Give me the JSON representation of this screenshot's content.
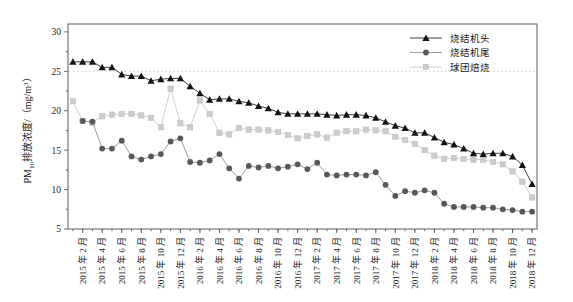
{
  "chart_data": {
    "type": "line",
    "title": "",
    "xlabel": "",
    "ylabel": "PM10排放浓度/（mg/m3）",
    "ylabel_parts": {
      "prefix": "PM",
      "subscript": "10",
      "middle": "排放浓度/（mg/m",
      "superscript": "3",
      "suffix": "）"
    },
    "ylim": [
      5,
      31
    ],
    "yticks": [
      5,
      10,
      15,
      20,
      25,
      30
    ],
    "ytick_labels": [
      "5",
      "10",
      "15",
      "20",
      "25",
      "30"
    ],
    "grid": "horizontal-dotted-at-25",
    "legend_position": "top-right",
    "x": [
      "2015年1月",
      "2015年2月",
      "2015年3月",
      "2015年4月",
      "2015年5月",
      "2015年6月",
      "2015年7月",
      "2015年8月",
      "2015年9月",
      "2015年10月",
      "2015年11月",
      "2015年12月",
      "2016年1月",
      "2016年2月",
      "2016年3月",
      "2016年4月",
      "2016年5月",
      "2016年6月",
      "2016年7月",
      "2016年8月",
      "2016年9月",
      "2016年10月",
      "2016年11月",
      "2016年12月",
      "2017年1月",
      "2017年2月",
      "2017年3月",
      "2017年4月",
      "2017年5月",
      "2017年6月",
      "2017年7月",
      "2017年8月",
      "2017年9月",
      "2017年10月",
      "2017年11月",
      "2017年12月",
      "2018年1月",
      "2018年2月",
      "2018年3月",
      "2018年4月",
      "2018年5月",
      "2018年6月",
      "2018年7月",
      "2018年8月",
      "2018年9月",
      "2018年10月",
      "2018年11月",
      "2018年12月"
    ],
    "xtick_labels": [
      "2015 年 2 月",
      "2015 年 4 月",
      "2015 年 6 月",
      "2015 年 8 月",
      "2015 年 10 月",
      "2015 年 12 月",
      "2016 年 2 月",
      "2016 年 4 月",
      "2016 年 6 月",
      "2016 年 8 月",
      "2016 年 10 月",
      "2016 年 12 月",
      "2017 年 2 月",
      "2017 年 4 月",
      "2017 年 6 月",
      "2017 年 8 月",
      "2017 年 10 月",
      "2017 年 12 月",
      "2018 年 2 月",
      "2018 年 4 月",
      "2018 年 6 月",
      "2018 年 8 月",
      "2018 年 10 月",
      "2018 年 12 月"
    ],
    "xtick_indices": [
      1,
      3,
      5,
      7,
      9,
      11,
      13,
      15,
      17,
      19,
      21,
      23,
      25,
      27,
      29,
      31,
      33,
      35,
      37,
      39,
      41,
      43,
      45,
      47
    ],
    "series": [
      {
        "name": "烧结机头",
        "marker": "triangle",
        "color": "#121212",
        "values": [
          26.2,
          26.2,
          26.2,
          25.5,
          25.5,
          24.6,
          24.4,
          24.4,
          23.8,
          24.0,
          24.1,
          24.1,
          23.1,
          22.2,
          21.4,
          21.5,
          21.5,
          21.2,
          21.0,
          20.6,
          20.3,
          19.8,
          19.6,
          19.6,
          19.6,
          19.6,
          19.5,
          19.4,
          19.5,
          19.5,
          19.4,
          19.1,
          18.6,
          18.1,
          17.8,
          17.2,
          17.2,
          16.6,
          16.0,
          15.7,
          15.2,
          14.6,
          14.5,
          14.6,
          14.6,
          14.2,
          13.1,
          10.7
        ]
      },
      {
        "name": "烧结机尾",
        "marker": "circle",
        "color": "#585858",
        "values": [
          null,
          18.7,
          18.6,
          15.2,
          15.2,
          16.2,
          14.2,
          13.8,
          14.2,
          14.5,
          16.1,
          16.5,
          13.5,
          13.4,
          13.7,
          14.5,
          12.7,
          11.4,
          13.0,
          12.8,
          13.0,
          12.7,
          12.9,
          13.2,
          12.6,
          13.4,
          11.9,
          11.8,
          11.9,
          11.9,
          11.8,
          12.2,
          10.6,
          9.2,
          9.8,
          9.6,
          9.9,
          9.6,
          8.2,
          7.8,
          7.8,
          7.8,
          7.7,
          7.7,
          7.5,
          7.4,
          7.2,
          7.2
        ]
      },
      {
        "name": "球团焙烧",
        "marker": "square",
        "color": "#cccccc",
        "values": [
          21.2,
          18.7,
          18.5,
          19.3,
          19.5,
          19.6,
          19.6,
          19.4,
          19.1,
          17.9,
          22.8,
          18.4,
          17.9,
          21.3,
          19.6,
          17.2,
          17.0,
          17.8,
          17.6,
          17.6,
          17.5,
          17.3,
          16.9,
          16.5,
          16.8,
          17.0,
          16.6,
          17.2,
          17.4,
          17.4,
          17.6,
          17.5,
          17.4,
          16.7,
          16.3,
          15.8,
          15.0,
          14.3,
          13.9,
          14.0,
          13.9,
          13.8,
          13.8,
          13.5,
          13.2,
          12.3,
          11.0,
          9.0
        ]
      }
    ]
  },
  "legend": {
    "items": [
      {
        "label": "烧结机头"
      },
      {
        "label": "烧结机尾"
      },
      {
        "label": "球团焙烧"
      }
    ]
  }
}
